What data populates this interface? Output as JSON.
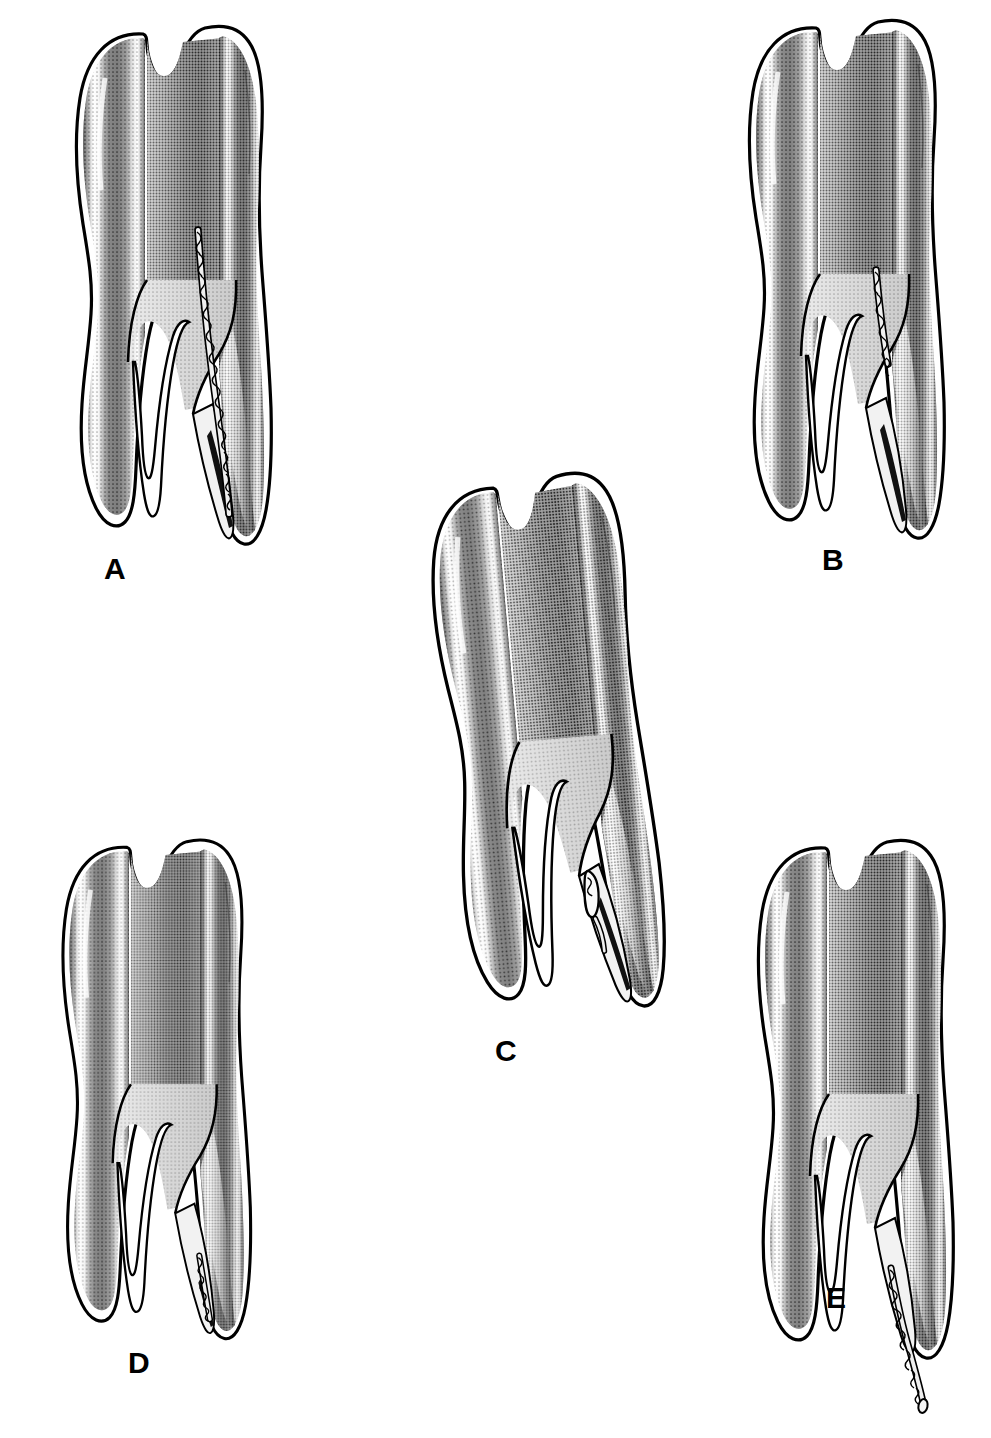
{
  "figure": {
    "background_color": "#ffffff",
    "ink_color": "#000000",
    "enamel_highlight_color": "#ffffff",
    "dentin_shade_color": "#9a9a9a",
    "pulp_shade_color": "#c8c8c8",
    "width": 991,
    "height": 1438,
    "panel_count": 5
  },
  "panels": [
    {
      "id": "A",
      "label": "A",
      "subject": "mandibular-molar-cross-section",
      "instrument": "endodontic-file",
      "file_position": "full-length-distal-canal-to-apex",
      "file_visible": true,
      "roots": 2,
      "canals": [
        "mesial",
        "distal"
      ],
      "label_x": 104,
      "label_y": 554
    },
    {
      "id": "B",
      "label": "B",
      "subject": "mandibular-molar-cross-section",
      "instrument": "endodontic-file",
      "file_position": "coronal-third-distal-canal",
      "file_visible": true,
      "roots": 2,
      "canals": [
        "mesial",
        "distal"
      ],
      "label_x": 822,
      "label_y": 545
    },
    {
      "id": "C",
      "label": "C",
      "subject": "mandibular-molar-cross-section",
      "instrument": "separated-file-fragment",
      "file_position": "middle-third-distal-canal",
      "file_visible": true,
      "roots": 2,
      "canals": [
        "mesial",
        "distal"
      ],
      "label_x": 495,
      "label_y": 1036
    },
    {
      "id": "D",
      "label": "D",
      "subject": "mandibular-molar-cross-section",
      "instrument": "separated-file-fragment",
      "file_position": "apical-third-distal-canal",
      "file_visible": true,
      "roots": 2,
      "canals": [
        "mesial",
        "distal"
      ],
      "label_x": 128,
      "label_y": 1348
    },
    {
      "id": "E",
      "label": "E",
      "subject": "mandibular-molar-cross-section",
      "instrument": "endodontic-file",
      "file_position": "extruded-beyond-apical-foramen",
      "file_visible": true,
      "roots": 2,
      "canals": [
        "mesial",
        "distal"
      ],
      "label_x": 826,
      "label_y": 1283
    }
  ]
}
